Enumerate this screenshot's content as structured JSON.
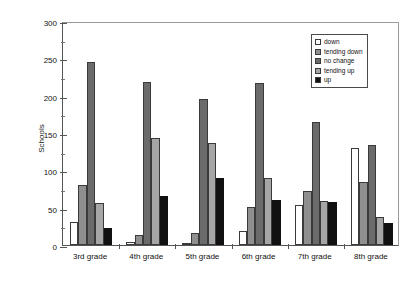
{
  "chart_data": {
    "type": "bar",
    "title": "",
    "xlabel": "",
    "ylabel": "Schools",
    "ylim": [
      0,
      300
    ],
    "yticks": [
      0,
      50,
      100,
      150,
      200,
      250,
      300
    ],
    "grid": false,
    "legend_position": "top-right",
    "categories": [
      "3rd grade",
      "4th grade",
      "5th grade",
      "6th grade",
      "7th grade",
      "8th grade"
    ],
    "series": [
      {
        "name": "down",
        "color": "#ffffff",
        "values": [
          31,
          4,
          3,
          19,
          53,
          130
        ]
      },
      {
        "name": "tending down",
        "color": "#8f8f8f",
        "values": [
          80,
          13,
          16,
          51,
          73,
          84
        ]
      },
      {
        "name": "no change",
        "color": "#6b6b6b",
        "values": [
          245,
          218,
          196,
          217,
          165,
          134
        ]
      },
      {
        "name": "tending up",
        "color": "#a6a6a6",
        "values": [
          56,
          143,
          136,
          90,
          59,
          37
        ]
      },
      {
        "name": "up",
        "color": "#111111",
        "values": [
          23,
          66,
          90,
          60,
          57,
          29
        ]
      }
    ]
  }
}
